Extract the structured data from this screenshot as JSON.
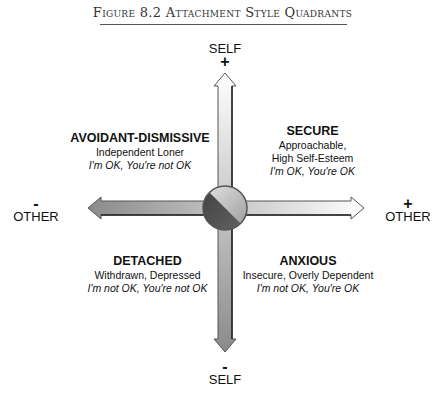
{
  "figure": {
    "title": "Figure 8.2  Attachment Style Quadrants"
  },
  "axes": {
    "top": {
      "sign": "+",
      "label": "SELF"
    },
    "bottom": {
      "sign": "-",
      "label": "SELF"
    },
    "left": {
      "sign": "-",
      "label": "OTHER"
    },
    "right": {
      "sign": "+",
      "label": "OTHER"
    }
  },
  "quadrants": {
    "top_left": {
      "title": "AVOIDANT-DISMISSIVE",
      "desc": "Independent Loner",
      "motto": "I'm OK, You're not OK"
    },
    "top_right": {
      "title": "SECURE",
      "desc": "Approachable, High Self-Esteem",
      "desc_lines": [
        "Approachable,",
        "High Self-Esteem"
      ],
      "motto": "I'm OK, You're OK"
    },
    "bottom_left": {
      "title": "DETACHED",
      "desc": "Withdrawn, Depressed",
      "motto": "I'm not OK, You're not OK"
    },
    "bottom_right": {
      "title": "ANXIOUS",
      "desc": "Insecure, Overly Dependent",
      "motto": "I'm not OK, You're OK"
    }
  },
  "colors": {
    "arrow_light": "#ffffff",
    "arrow_dark": "#8a8a8a",
    "circle_light": "#c8c8c8",
    "circle_dark": "#4a4a4a",
    "outline": "#222222"
  }
}
